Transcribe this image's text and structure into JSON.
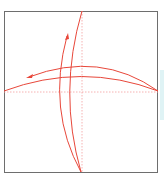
{
  "diagram": {
    "type": "origami-fold-step",
    "colors": {
      "paper_border": "#6e6e6e",
      "fold_lines": "#e8473a",
      "guide_lines": "#f4a0a0",
      "background": "#ffffff",
      "edge_strip": "#dff3f5"
    },
    "paper": {
      "x": 5,
      "y": 11,
      "width": 153,
      "height": 161
    },
    "guides": {
      "vertical_x": 82,
      "horizontal_y": 92
    },
    "arrows": [
      {
        "name": "vertical-fold-arrow",
        "direction": "up"
      },
      {
        "name": "horizontal-fold-arrow",
        "direction": "left"
      }
    ]
  }
}
